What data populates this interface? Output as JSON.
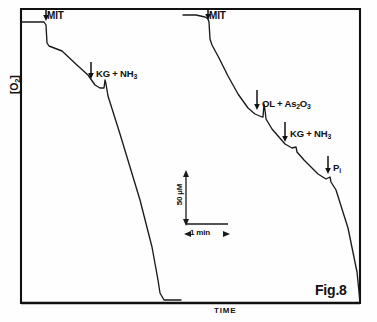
{
  "figure": {
    "caption": "Fig.8",
    "y_axis_label": "[O2]",
    "x_axis_label": "TIME",
    "background_color": "#fefefe",
    "trace_color": "#1a1a1a",
    "frame_color": "#111111"
  },
  "scale_bars": {
    "vertical_label": "50 µM",
    "horizontal_label": "1 min"
  },
  "annotations": {
    "mit_left": "MIT",
    "mit_right": "MIT",
    "kg_nh3_left": "KG + NH3",
    "ol_as2o3_right": "OL + As2O3",
    "kg_nh3_right": "KG + NH3",
    "pi_right": "Pi"
  },
  "chart_data": {
    "type": "line",
    "title": "Fig.8",
    "xlabel": "TIME",
    "ylabel": "[O2]",
    "grid": false,
    "legend": false,
    "axis_frame": {
      "x0": 21,
      "y0": 9,
      "x1": 360,
      "y1": 303
    },
    "xlim": [
      0,
      377
    ],
    "ylim": [
      322,
      0
    ],
    "note": "Oxygen-electrode (oxygraph) polarographic traces; y decreases downward as O2 is consumed. Coordinates are pixel positions within the 377x322 figure.",
    "series": [
      {
        "name": "trace-left",
        "points": [
          [
            21,
            22
          ],
          [
            44,
            22
          ],
          [
            46,
            25
          ],
          [
            47,
            43
          ],
          [
            49,
            46
          ],
          [
            62,
            51
          ],
          [
            78,
            66
          ],
          [
            88,
            75
          ],
          [
            95,
            85
          ],
          [
            100,
            88
          ],
          [
            104,
            88
          ],
          [
            105,
            80
          ],
          [
            106,
            84
          ],
          [
            107,
            90
          ],
          [
            108,
            96
          ],
          [
            120,
            134
          ],
          [
            140,
            200
          ],
          [
            152,
            247
          ],
          [
            158,
            280
          ],
          [
            160,
            293
          ],
          [
            164,
            300
          ],
          [
            181,
            300
          ]
        ],
        "events": [
          {
            "label": "MIT",
            "x": 46,
            "arrow_x": 46,
            "arrow_y0": 10,
            "arrow_y1": 21
          },
          {
            "label": "KG + NH3",
            "x": 105,
            "arrow_x": 91,
            "arrow_y0": 62,
            "arrow_y1": 79
          }
        ]
      },
      {
        "name": "trace-right",
        "points": [
          [
            183,
            15
          ],
          [
            196,
            15
          ],
          [
            205,
            17
          ],
          [
            208,
            19
          ],
          [
            209,
            22
          ],
          [
            210,
            39
          ],
          [
            212,
            45
          ],
          [
            219,
            58
          ],
          [
            228,
            76
          ],
          [
            238,
            94
          ],
          [
            248,
            108
          ],
          [
            255,
            114
          ],
          [
            262,
            117
          ],
          [
            263,
            117
          ],
          [
            264,
            104
          ],
          [
            265,
            110
          ],
          [
            266,
            119
          ],
          [
            272,
            129
          ],
          [
            285,
            144
          ],
          [
            292,
            148
          ],
          [
            296,
            147
          ],
          [
            297,
            152
          ],
          [
            304,
            160
          ],
          [
            318,
            174
          ],
          [
            326,
            179
          ],
          [
            330,
            177
          ],
          [
            331,
            182
          ],
          [
            336,
            190
          ],
          [
            348,
            228
          ],
          [
            357,
            272
          ],
          [
            359,
            292
          ],
          [
            360,
            303
          ]
        ],
        "events": [
          {
            "label": "MIT",
            "x": 209,
            "arrow_x": 208,
            "arrow_y0": 10,
            "arrow_y1": 20
          },
          {
            "label": "OL + As2O3",
            "x": 264,
            "arrow_x": 257,
            "arrow_y0": 90,
            "arrow_y1": 110
          },
          {
            "label": "KG + NH3",
            "x": 296,
            "arrow_x": 285,
            "arrow_y0": 122,
            "arrow_y1": 142
          },
          {
            "label": "Pi",
            "x": 330,
            "arrow_x": 328,
            "arrow_y0": 156,
            "arrow_y1": 174
          }
        ]
      }
    ],
    "scale_bar": {
      "vertical": {
        "x": 186,
        "y_top": 172,
        "y_bottom": 224,
        "label": "50 µM"
      },
      "horizontal": {
        "y": 224,
        "x_left": 186,
        "x_right": 228,
        "label": "1 min"
      }
    }
  }
}
